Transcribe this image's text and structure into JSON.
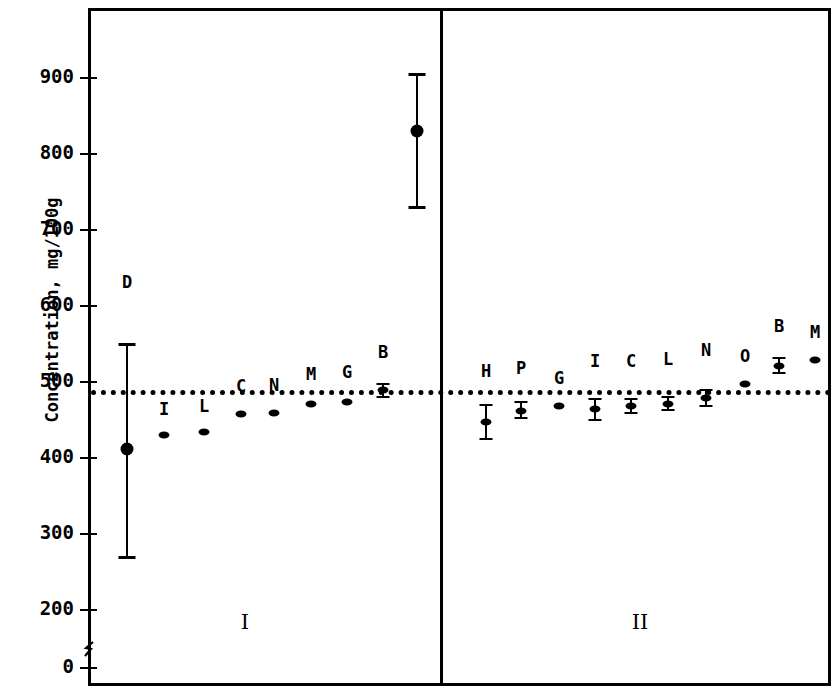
{
  "chart_data": {
    "type": "scatter",
    "title": "",
    "xlabel": "",
    "ylabel": "Concentration, mg/100g",
    "ylim": [
      0,
      960
    ],
    "yticks": [
      900,
      800,
      700,
      600,
      500,
      400,
      300,
      200,
      0
    ],
    "ytick_labels": [
      "900",
      "800",
      "700",
      "600",
      "500",
      "400",
      "300",
      "200",
      "0"
    ],
    "axis_break": true,
    "grid": false,
    "legend": "none",
    "reference_line": {
      "label": "",
      "value": 490,
      "style": "dotted"
    },
    "panels": [
      {
        "name": "I",
        "points": [
          {
            "label": "D",
            "value": 412,
            "err_low": 270,
            "err_high": 550
          },
          {
            "label": "I",
            "value": 430,
            "err_low": 430,
            "err_high": 430
          },
          {
            "label": "L",
            "value": 434,
            "err_low": 434,
            "err_high": 434
          },
          {
            "label": "C",
            "value": 458,
            "err_low": 458,
            "err_high": 458
          },
          {
            "label": "N",
            "value": 459,
            "err_low": 459,
            "err_high": 459
          },
          {
            "label": "M",
            "value": 471,
            "err_low": 471,
            "err_high": 471
          },
          {
            "label": "G",
            "value": 474,
            "err_low": 474,
            "err_high": 474
          },
          {
            "label": "B",
            "value": 489,
            "err_low": 480,
            "err_high": 498
          },
          {
            "label": "O",
            "value": 830,
            "err_low": 730,
            "err_high": 905
          }
        ]
      },
      {
        "name": "II",
        "points": [
          {
            "label": "H",
            "value": 447,
            "err_low": 425,
            "err_high": 470
          },
          {
            "label": "P",
            "value": 462,
            "err_low": 452,
            "err_high": 474
          },
          {
            "label": "G",
            "value": 469,
            "err_low": 469,
            "err_high": 469
          },
          {
            "label": "I",
            "value": 464,
            "err_low": 450,
            "err_high": 478
          },
          {
            "label": "C",
            "value": 468,
            "err_low": 459,
            "err_high": 477
          },
          {
            "label": "L",
            "value": 471,
            "err_low": 463,
            "err_high": 480
          },
          {
            "label": "N",
            "value": 479,
            "err_low": 469,
            "err_high": 489
          },
          {
            "label": "O",
            "value": 498,
            "err_low": 498,
            "err_high": 498
          },
          {
            "label": "B",
            "value": 521,
            "err_low": 512,
            "err_high": 531
          },
          {
            "label": "M",
            "value": 529,
            "err_low": 529,
            "err_high": 529
          }
        ]
      }
    ]
  }
}
